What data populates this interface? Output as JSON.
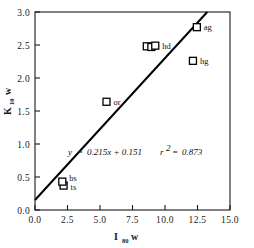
{
  "chart_data": {
    "type": "scatter",
    "title": "",
    "subtitle": "",
    "xlabel": "I80w",
    "xlabel_main": "I",
    "xlabel_sub": "80",
    "xlabel_tail": "w",
    "ylabel": "K10w",
    "ylabel_main": "K",
    "ylabel_sub": "10",
    "ylabel_tail": "w",
    "xlim": [
      0.0,
      15.0
    ],
    "ylim": [
      0.0,
      3.0
    ],
    "xticks": [
      "0.0",
      "2.5",
      "5.0",
      "7.5",
      "10.0",
      "12.5",
      "15.0"
    ],
    "xtick_values": [
      0.0,
      2.5,
      5.0,
      7.5,
      10.0,
      12.5,
      15.0
    ],
    "yticks": [
      "0.0",
      "0.5",
      "1.0",
      "1.5",
      "2.0",
      "2.5",
      "3.0"
    ],
    "ytick_values": [
      0.0,
      0.5,
      1.0,
      1.5,
      2.0,
      2.5,
      3.0
    ],
    "grid": false,
    "legend": "none",
    "marker": "open-square",
    "marker_color": "#000000",
    "line_color": "#000000",
    "points": [
      {
        "label": "ts",
        "x": 2.2,
        "y": 0.37,
        "label_dx": 7,
        "label_dy": 4
      },
      {
        "label": "bs",
        "x": 2.1,
        "y": 0.43,
        "label_dx": 7,
        "label_dy": -1
      },
      {
        "label": "or",
        "x": 5.5,
        "y": 1.64,
        "label_dx": 7,
        "label_dy": 3
      },
      {
        "label": "",
        "x": 8.6,
        "y": 2.48,
        "label_dx": 0,
        "label_dy": 0
      },
      {
        "label": "",
        "x": 8.95,
        "y": 2.47,
        "label_dx": 0,
        "label_dy": 0
      },
      {
        "label": "hd",
        "x": 9.25,
        "y": 2.49,
        "label_dx": 7,
        "label_dy": 3
      },
      {
        "label": "hg",
        "x": 12.15,
        "y": 2.26,
        "label_dx": 7,
        "label_dy": 3
      },
      {
        "label": "ag",
        "x": 12.45,
        "y": 2.77,
        "label_dx": 7,
        "label_dy": 3
      }
    ],
    "fit": {
      "slope": 0.215,
      "intercept": 0.151,
      "r_squared": 0.873,
      "equation_y": "y",
      "equation_eq": "=",
      "equation_body": "0.215x + 0.151",
      "r2_symbol": "r",
      "r2_exp": "2",
      "r2_eq": "=",
      "r2_value": "0.873",
      "x_start": 0.0,
      "x_end": 13.25
    }
  },
  "annotations": {
    "equation_full": "y = 0.215x + 0.151   r2 = 0.873"
  }
}
